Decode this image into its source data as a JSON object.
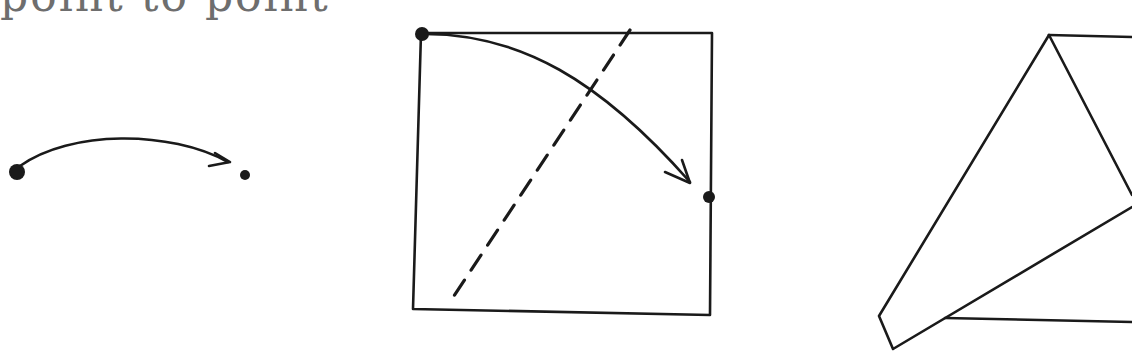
{
  "caption": {
    "text": "point to point",
    "color": "#6e6e6e",
    "clipped": true
  },
  "figures": [
    {
      "id": "fig-1",
      "description": "Curved arrow from a large dot to a small dot"
    },
    {
      "id": "fig-2",
      "description": "Square paper with dashed fold line; arrow from top-left corner to a point on the right edge"
    },
    {
      "id": "fig-3",
      "description": "Paper after folding: top-left corner brought to the right edge, forming a triangular flap"
    }
  ],
  "colors": {
    "ink": "#1a1a1a",
    "background": "#ffffff"
  }
}
